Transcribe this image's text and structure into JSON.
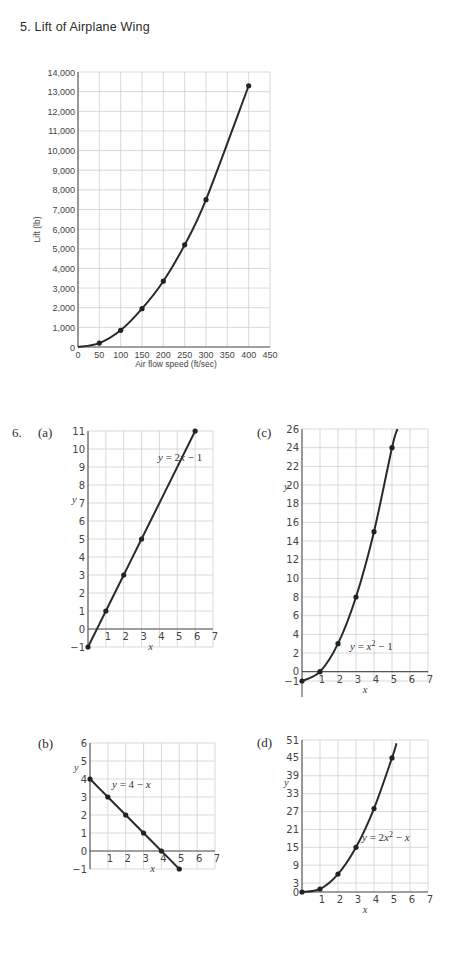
{
  "page": {
    "problem5_title": "5. Lift of Airplane Wing",
    "problem6_label": "6.",
    "sub_labels": {
      "a": "(a)",
      "b": "(b)",
      "c": "(c)",
      "d": "(d)"
    }
  },
  "chart_data": [
    {
      "id": "lift",
      "type": "line",
      "title": "Lift of Airplane Wing",
      "xlabel": "Air flow speed (ft/sec)",
      "ylabel": "Lift (lb)",
      "xlim": [
        0,
        450
      ],
      "ylim": [
        0,
        14000
      ],
      "xticks": [
        0,
        50,
        100,
        150,
        200,
        250,
        300,
        350,
        400,
        450
      ],
      "yticks": [
        0,
        1000,
        2000,
        3000,
        4000,
        5000,
        6000,
        7000,
        8000,
        9000,
        10000,
        11000,
        12000,
        13000,
        14000
      ],
      "ytick_labels": [
        "0",
        "1,000",
        "2,000",
        "3,000",
        "4,000",
        "5,000",
        "6,000",
        "7,000",
        "8,000",
        "9,000",
        "10,000",
        "11,000",
        "12,000",
        "13,000",
        "14,000"
      ],
      "grid": true,
      "x": [
        50,
        100,
        150,
        200,
        250,
        300,
        400
      ],
      "y": [
        200,
        850,
        1950,
        3350,
        5200,
        7500,
        13300
      ],
      "curve": "smooth through origin"
    },
    {
      "id": "a",
      "type": "line",
      "label": "(a)",
      "equation": "y = 2x − 1",
      "xlabel": "x",
      "ylabel": "y",
      "xlim": [
        0,
        7
      ],
      "ylim": [
        -1,
        11
      ],
      "xticks": [
        1,
        2,
        3,
        4,
        5,
        6,
        7
      ],
      "yticks": [
        -1,
        0,
        1,
        2,
        3,
        4,
        5,
        6,
        7,
        8,
        9,
        10,
        11
      ],
      "grid": true,
      "x": [
        0,
        1,
        2,
        3,
        6
      ],
      "y": [
        -1,
        1,
        3,
        5,
        11
      ]
    },
    {
      "id": "b",
      "type": "line",
      "label": "(b)",
      "equation": "y = 4 − x",
      "xlabel": "x",
      "ylabel": "y",
      "xlim": [
        0,
        7
      ],
      "ylim": [
        -1,
        6
      ],
      "xticks": [
        1,
        2,
        3,
        4,
        5,
        6,
        7
      ],
      "yticks": [
        -1,
        0,
        1,
        2,
        3,
        4,
        5,
        6
      ],
      "grid": true,
      "x": [
        0,
        1,
        2,
        3,
        4,
        5
      ],
      "y": [
        4,
        3,
        2,
        1,
        0,
        -1
      ]
    },
    {
      "id": "c",
      "type": "line",
      "label": "(c)",
      "equation": "y = x² − 1",
      "xlabel": "x",
      "ylabel": "y",
      "xlim": [
        0,
        7
      ],
      "ylim": [
        -1,
        26
      ],
      "xticks": [
        1,
        2,
        3,
        4,
        5,
        6,
        7
      ],
      "yticks": [
        -1,
        0,
        2,
        4,
        6,
        8,
        10,
        12,
        14,
        16,
        18,
        20,
        22,
        24,
        26
      ],
      "grid": true,
      "x": [
        0,
        1,
        2,
        3,
        4,
        5
      ],
      "y": [
        -1,
        0,
        3,
        8,
        15,
        24
      ]
    },
    {
      "id": "d",
      "type": "line",
      "label": "(d)",
      "equation": "y = 2x² − x",
      "xlabel": "x",
      "ylabel": "y",
      "xlim": [
        0,
        7
      ],
      "ylim": [
        0,
        51
      ],
      "xticks": [
        1,
        2,
        3,
        4,
        5,
        6,
        7
      ],
      "yticks": [
        0,
        3,
        9,
        15,
        21,
        27,
        33,
        39,
        45,
        51
      ],
      "grid": true,
      "x": [
        0,
        1,
        2,
        3,
        4,
        5
      ],
      "y": [
        0,
        1,
        6,
        15,
        28,
        45
      ]
    }
  ]
}
